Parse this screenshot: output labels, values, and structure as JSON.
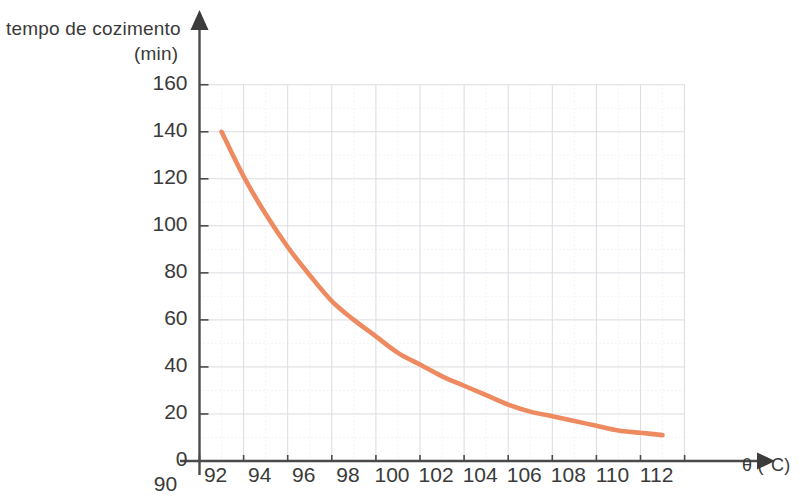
{
  "chart_data": {
    "type": "line",
    "title": "",
    "ylabel": "tempo de cozimento",
    "yunit": "(min)",
    "xlabel": "θ (°C)",
    "xlim": [
      90,
      112
    ],
    "ylim": [
      0,
      160
    ],
    "grid": true,
    "grid_minor_x_step": 1,
    "grid_major_x_step": 2,
    "grid_minor_y_step": 10,
    "grid_major_y_step": 20,
    "legend": "none",
    "series": [
      {
        "name": "tempo de cozimento",
        "color": "#ee8a5f",
        "x": [
          91,
          92,
          93,
          94,
          95,
          96,
          97,
          98,
          99,
          100,
          101,
          102,
          103,
          104,
          105,
          106,
          107,
          108,
          109,
          110,
          111
        ],
        "values": [
          140,
          121,
          105,
          91,
          79,
          68,
          60,
          53,
          46,
          41,
          36,
          32,
          28,
          24,
          21,
          19,
          17,
          15,
          13,
          12,
          11
        ]
      }
    ],
    "xticks": [
      90,
      92,
      94,
      96,
      98,
      100,
      102,
      104,
      106,
      108,
      110,
      112
    ],
    "xtick_labels": [
      "90",
      "92",
      "94",
      "96",
      "98",
      "100",
      "102",
      "104",
      "106",
      "108",
      "110",
      "112"
    ],
    "yticks": [
      0,
      20,
      40,
      60,
      80,
      100,
      120,
      140,
      160
    ],
    "ytick_labels": [
      "0",
      "20",
      "40",
      "60",
      "80",
      "100",
      "120",
      "140",
      "160"
    ]
  },
  "axes": {
    "y_title_line1": "tempo de cozimento",
    "y_title_line2": "(min)",
    "x_title": "θ (°C)"
  },
  "colors": {
    "curve": "#ee8a5f",
    "axis": "#4a4a4a",
    "text": "#3a3a3a",
    "grid_minor": "#e8e8ec",
    "grid_major": "#dcdce2",
    "background": "#ffffff"
  }
}
